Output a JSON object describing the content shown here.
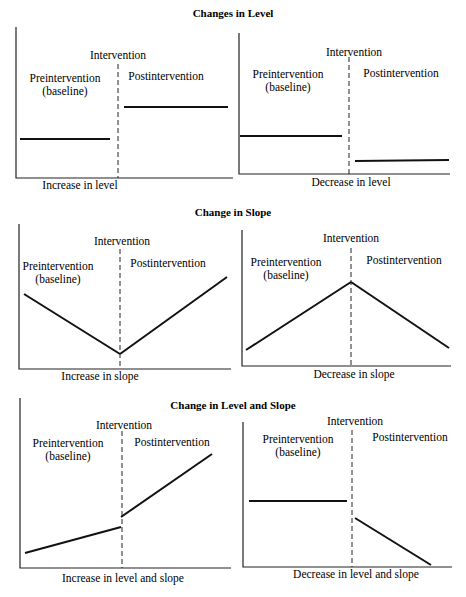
{
  "sections": [
    {
      "title": "Changes in Level",
      "panels": [
        {
          "id": "increase-level",
          "caption": "Increase in level",
          "intervention_label": "Intervention",
          "pre_label_1": "Preintervention",
          "pre_label_2": "(baseline)",
          "post_label": "Postintervention",
          "axis": {
            "x0": 16,
            "y0": 27,
            "x1": 233,
            "y1": 178
          },
          "intervention_x": 118,
          "intervention_top": 64,
          "pre_segments": [
            [
              20,
              139,
              110,
              139
            ]
          ],
          "post_segments": [
            [
              124,
              107,
              228,
              107
            ]
          ],
          "label_pos": {
            "intervention": [
              118,
              59
            ],
            "pre1": [
              65,
              82
            ],
            "pre2": [
              65,
              95
            ],
            "post": [
              166,
              80
            ],
            "caption": [
              80,
              189
            ]
          }
        },
        {
          "id": "decrease-level",
          "caption": "Decrease in level",
          "intervention_label": "Intervention",
          "pre_label_1": "Preintervention",
          "pre_label_2": "(baseline)",
          "post_label": "Postintervention",
          "axis": {
            "x0": 239,
            "y0": 33,
            "x1": 450,
            "y1": 174
          },
          "intervention_x": 349,
          "intervention_top": 57,
          "pre_segments": [
            [
              240,
              136,
              342,
              136
            ]
          ],
          "post_segments": [
            [
              355,
              161,
              449,
              160
            ]
          ],
          "label_pos": {
            "intervention": [
              354,
              56
            ],
            "pre1": [
              288,
              78
            ],
            "pre2": [
              288,
              91
            ],
            "post": [
              401,
              77
            ],
            "caption": [
              351,
              186
            ]
          }
        }
      ]
    },
    {
      "title": "Change in Slope",
      "panels": [
        {
          "id": "increase-slope",
          "caption": "Increase in slope",
          "intervention_label": "Intervention",
          "pre_label_1": "Preintervention",
          "pre_label_2": "(baseline)",
          "post_label": "Postintervention",
          "axis": {
            "x0": 19,
            "y0": 224,
            "x1": 231,
            "y1": 369
          },
          "intervention_x": 120,
          "intervention_top": 249,
          "pre_segments": [
            [
              24,
              294,
              120,
              354
            ]
          ],
          "post_segments": [
            [
              120,
              354,
              227,
              277
            ]
          ],
          "label_pos": {
            "intervention": [
              122,
              245
            ],
            "pre1": [
              58,
              270
            ],
            "pre2": [
              58,
              283
            ],
            "post": [
              168,
              267
            ],
            "caption": [
              100,
              380
            ]
          }
        },
        {
          "id": "decrease-slope",
          "caption": "Decrease in slope",
          "intervention_label": "Intervention",
          "pre_label_1": "Preintervention",
          "pre_label_2": "(baseline)",
          "post_label": "Postintervention",
          "axis": {
            "x0": 242,
            "y0": 230,
            "x1": 451,
            "y1": 366
          },
          "intervention_x": 351,
          "intervention_top": 248,
          "pre_segments": [
            [
              246,
              350,
              351,
              282
            ]
          ],
          "post_segments": [
            [
              351,
              282,
              449,
              348
            ]
          ],
          "label_pos": {
            "intervention": [
              351,
              242
            ],
            "pre1": [
              286,
              266
            ],
            "pre2": [
              286,
              279
            ],
            "post": [
              404,
              264
            ],
            "caption": [
              354,
              378
            ]
          }
        }
      ]
    },
    {
      "title": "Change in Level and Slope",
      "panels": [
        {
          "id": "increase-level-slope",
          "caption": "Increase in level and slope",
          "intervention_label": "Intervention",
          "pre_label_1": "Preintervention",
          "pre_label_2": "(baseline)",
          "post_label": "Postintervention",
          "axis": {
            "x0": 20,
            "y0": 398,
            "x1": 231,
            "y1": 568
          },
          "intervention_x": 122,
          "intervention_top": 431,
          "pre_segments": [
            [
              25,
              553,
              121,
              527
            ]
          ],
          "post_segments": [
            [
              121,
              517,
              212,
              454
            ]
          ],
          "label_pos": {
            "intervention": [
              124,
              429
            ],
            "pre1": [
              68,
              447
            ],
            "pre2": [
              68,
              460
            ],
            "post": [
              172,
              446
            ],
            "caption": [
              123,
              582
            ]
          }
        },
        {
          "id": "decrease-level-slope",
          "caption": "Decrease in level and slope",
          "intervention_label": "Intervention",
          "pre_label_1": "Preintervention",
          "pre_label_2": "(baseline)",
          "post_label": "Postintervention",
          "axis": {
            "x0": 243,
            "y0": 422,
            "x1": 452,
            "y1": 567
          },
          "intervention_x": 352,
          "intervention_top": 430,
          "pre_segments": [
            [
              249,
              501,
              347,
              501
            ]
          ],
          "post_segments": [
            [
              355,
              518,
              431,
              565
            ]
          ],
          "label_pos": {
            "intervention": [
              355,
              425
            ],
            "pre1": [
              298,
              443
            ],
            "pre2": [
              298,
              456
            ],
            "post": [
              410,
              441
            ],
            "caption": [
              356,
              578
            ]
          }
        }
      ]
    }
  ],
  "section_title_pos": [
    [
      233,
      17
    ],
    [
      233,
      216
    ],
    [
      233,
      409
    ]
  ],
  "footer_text": "",
  "chart_data": [
    {
      "type": "line",
      "title": "Changes in Level",
      "xlabel": "Increase in level",
      "annotations": [
        "Intervention",
        "Preintervention (baseline)",
        "Postintervention"
      ],
      "series": [
        {
          "name": "Preintervention",
          "values": [
            2,
            2
          ]
        },
        {
          "name": "Postintervention",
          "values": [
            5,
            5
          ]
        }
      ],
      "grid": false
    },
    {
      "type": "line",
      "title": "Changes in Level",
      "xlabel": "Decrease in level",
      "annotations": [
        "Intervention",
        "Preintervention (baseline)",
        "Postintervention"
      ],
      "series": [
        {
          "name": "Preintervention",
          "values": [
            3,
            3
          ]
        },
        {
          "name": "Postintervention",
          "values": [
            1,
            1
          ]
        }
      ],
      "grid": false
    },
    {
      "type": "line",
      "title": "Change in Slope",
      "xlabel": "Increase in slope",
      "annotations": [
        "Intervention",
        "Preintervention (baseline)",
        "Postintervention"
      ],
      "series": [
        {
          "name": "Preintervention",
          "values": [
            5,
            1
          ]
        },
        {
          "name": "Postintervention",
          "values": [
            1,
            6
          ]
        }
      ],
      "grid": false
    },
    {
      "type": "line",
      "title": "Change in Slope",
      "xlabel": "Decrease in slope",
      "annotations": [
        "Intervention",
        "Preintervention (baseline)",
        "Postintervention"
      ],
      "series": [
        {
          "name": "Preintervention",
          "values": [
            1,
            6
          ]
        },
        {
          "name": "Postintervention",
          "values": [
            6,
            1
          ]
        }
      ],
      "grid": false
    },
    {
      "type": "line",
      "title": "Change in Level and Slope",
      "xlabel": "Increase in level and slope",
      "annotations": [
        "Intervention",
        "Preintervention (baseline)",
        "Postintervention"
      ],
      "series": [
        {
          "name": "Preintervention",
          "values": [
            1,
            2.5
          ]
        },
        {
          "name": "Postintervention",
          "values": [
            3.5,
            7.5
          ]
        }
      ],
      "grid": false
    },
    {
      "type": "line",
      "title": "Change in Level and Slope",
      "xlabel": "Decrease in level and slope",
      "annotations": [
        "Intervention",
        "Preintervention (baseline)",
        "Postintervention"
      ],
      "series": [
        {
          "name": "Preintervention",
          "values": [
            4.5,
            4.5
          ]
        },
        {
          "name": "Postintervention",
          "values": [
            3.5,
            0
          ]
        }
      ],
      "grid": false
    }
  ]
}
